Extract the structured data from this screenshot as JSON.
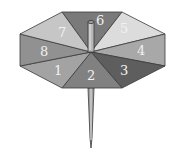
{
  "figure": {
    "center": [
      91,
      52
    ],
    "vertices": [
      [
        62,
        12
      ],
      [
        122,
        12
      ],
      [
        165,
        34
      ],
      [
        165,
        66
      ],
      [
        122,
        88
      ],
      [
        62,
        88
      ],
      [
        20,
        66
      ],
      [
        20,
        34
      ]
    ],
    "sections": [
      {
        "label": "6",
        "points": "62,12 122,12 91,52",
        "fill": "#7a7a7a",
        "text_pos": [
          96,
          25
        ]
      },
      {
        "label": "5",
        "points": "122,12 165,34 91,52",
        "fill": "#dcdcdc",
        "text_pos": [
          120,
          33
        ]
      },
      {
        "label": "4",
        "points": "165,34 165,66 91,52",
        "fill": "#a8a8a8",
        "text_pos": [
          137,
          55
        ]
      },
      {
        "label": "3",
        "points": "165,66 122,88 91,52",
        "fill": "#5e5e5e",
        "text_pos": [
          120,
          75
        ]
      },
      {
        "label": "2",
        "points": "122,88 62,88 91,52",
        "fill": "#818181",
        "text_pos": [
          87,
          80
        ]
      },
      {
        "label": "1",
        "points": "62,88 20,66 91,52",
        "fill": "#a3a3a3",
        "text_pos": [
          54,
          75
        ]
      },
      {
        "label": "8",
        "points": "20,66 20,34 91,52",
        "fill": "#919191",
        "text_pos": [
          40,
          56
        ]
      },
      {
        "label": "7",
        "points": "20,34 62,12 91,52",
        "fill": "#c6c6c6",
        "text_pos": [
          58,
          37
        ]
      }
    ],
    "pole": {
      "x": 91,
      "top": 22,
      "bottom": 52,
      "width": 6,
      "fill": "#b8b8b8",
      "cap": "#9a9a9a"
    },
    "spike": {
      "x": 91,
      "top": 88,
      "tip": 148,
      "half_width": 3,
      "fill": "#a0a0a0"
    },
    "stroke": "#3a3a3a"
  }
}
